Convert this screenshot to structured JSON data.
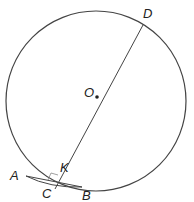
{
  "diagram": {
    "type": "circle-geometry",
    "labels": {
      "A": "A",
      "B": "B",
      "C": "C",
      "D": "D",
      "K": "K",
      "O": "O"
    },
    "colors": {
      "stroke": "#444444",
      "label": "#222222",
      "background": "#ffffff"
    },
    "elements": [
      "circle centered at O",
      "diameter-line through D, O, K, C",
      "chord AB",
      "arc AB",
      "right-angle marker at K"
    ]
  }
}
